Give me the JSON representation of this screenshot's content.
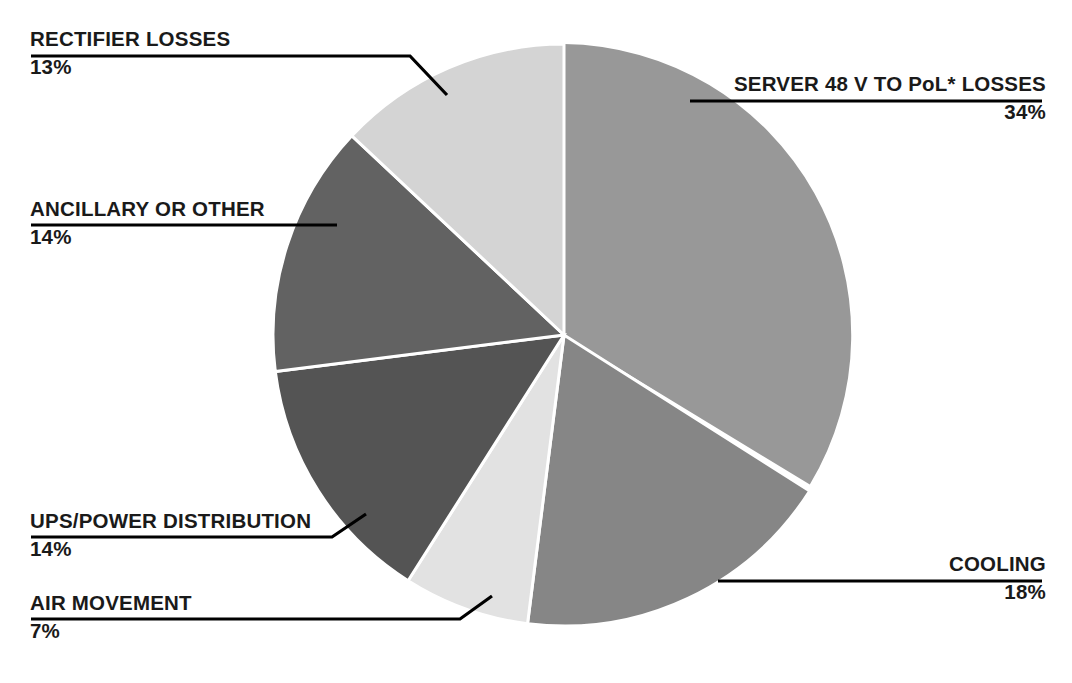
{
  "chart_data": {
    "type": "pie",
    "title": "",
    "subtitle": "",
    "xlabel": "",
    "ylabel": "",
    "legend_position": "callout-labels",
    "grid": false,
    "units": "%",
    "start_angle_deg": 0,
    "direction": "clockwise",
    "categories": [
      "SERVER 48 V TO PoL* LOSSES",
      "COOLING",
      "AIR MOVEMENT",
      "UPS/POWER DISTRIBUTION",
      "ANCILLARY OR OTHER",
      "RECTIFIER LOSSES"
    ],
    "values": [
      34,
      18,
      7,
      14,
      14,
      13
    ],
    "slices": [
      {
        "label": "SERVER 48 V TO PoL* LOSSES",
        "value": 34,
        "value_text": "34%",
        "color": "#989898"
      },
      {
        "label": "COOLING",
        "value": 18,
        "value_text": "18%",
        "color": "#868686"
      },
      {
        "label": "AIR MOVEMENT",
        "value": 7,
        "value_text": "7%",
        "color": "#e2e2e2"
      },
      {
        "label": "UPS/POWER DISTRIBUTION",
        "value": 14,
        "value_text": "14%",
        "color": "#545454"
      },
      {
        "label": "ANCILLARY OR OTHER",
        "value": 14,
        "value_text": "14%",
        "color": "#626262"
      },
      {
        "label": "RECTIFIER LOSSES",
        "value": 13,
        "value_text": "13%",
        "color": "#d4d4d4"
      }
    ]
  },
  "colors": {
    "background": "#ffffff",
    "text": "#1a1a1a",
    "leader_line": "#000000",
    "slice_divider": "#ffffff"
  }
}
